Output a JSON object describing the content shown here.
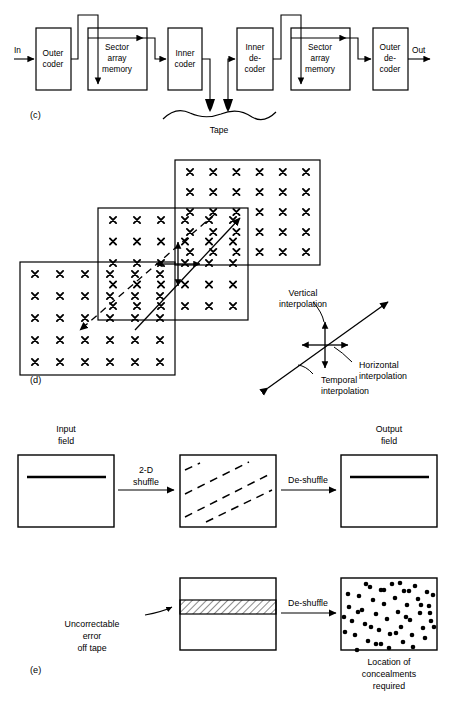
{
  "figure": {
    "panels": [
      "(c)",
      "(d)",
      "(e)"
    ]
  },
  "panel_c": {
    "label": "(c)",
    "input_label": "In",
    "output_label": "Out",
    "tape_label": "Tape",
    "blocks": [
      {
        "id": "outer-coder",
        "line1": "Outer",
        "line2": "coder",
        "line3": ""
      },
      {
        "id": "sector-array-memory-1",
        "line1": "Sector",
        "line2": "array",
        "line3": "memory"
      },
      {
        "id": "inner-coder",
        "line1": "Inner",
        "line2": "coder",
        "line3": ""
      },
      {
        "id": "inner-decoder",
        "line1": "Inner",
        "line2": "de-",
        "line3": "coder"
      },
      {
        "id": "sector-array-memory-2",
        "line1": "Sector",
        "line2": "array",
        "line3": "memory"
      },
      {
        "id": "outer-decoder",
        "line1": "Outer",
        "line2": "de-",
        "line3": "coder"
      }
    ]
  },
  "panel_d": {
    "label": "(d)",
    "fields": [
      {
        "id": "field-back",
        "cols": 6,
        "rows": 5
      },
      {
        "id": "field-middle",
        "cols": 6,
        "rows": 5
      },
      {
        "id": "field-front",
        "cols": 6,
        "rows": 5
      }
    ],
    "legend": {
      "vertical_line1": "Vertical",
      "vertical_line2": "interpolation",
      "horizontal_line1": "Horizontal",
      "horizontal_line2": "interpolation",
      "temporal_line1": "Temporal",
      "temporal_line2": "interpolation"
    }
  },
  "panel_e": {
    "label": "(e)",
    "row1": {
      "input_line1": "Input",
      "input_line2": "field",
      "arrow1_line1": "2-D",
      "arrow1_line2": "shuffle",
      "arrow2_label": "De-shuffle",
      "output_line1": "Output",
      "output_line2": "field",
      "shuffle_dash_count": 4
    },
    "row2": {
      "error_line1": "Uncorrectable",
      "error_line2": "error",
      "error_line3": "off tape",
      "arrow_label": "De-shuffle",
      "result_line1": "Location of",
      "result_line2": "concealments",
      "result_line3": "required",
      "concealment_dot_count": 52
    }
  },
  "colors": {
    "ink": "#000000",
    "paper": "#ffffff"
  }
}
